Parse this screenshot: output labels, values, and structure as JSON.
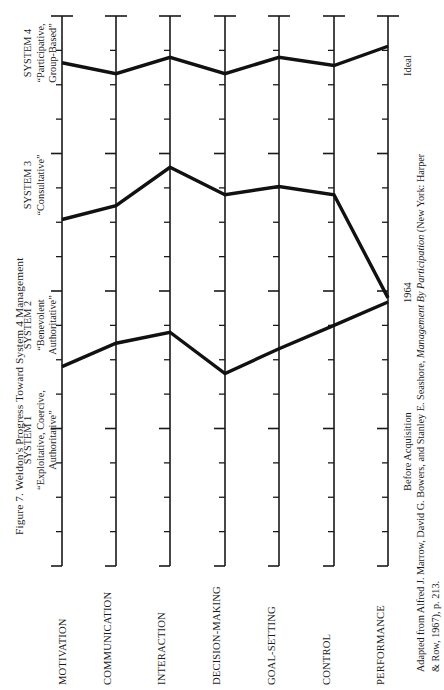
{
  "figure": {
    "title": "Figure 7. Weldon's Progress Toward System 4 Management",
    "orientation": "rotated-90-ccw"
  },
  "source": {
    "line1": "Adapted from Alfred J. Marrow, David G. Bowers, and Stanley E. Seashore, ",
    "line1_italic": "Management By Participation",
    "line1_tail": " (New York: Harper",
    "line2": "& Row, 1967), p. 213."
  },
  "axis": {
    "system_labels": [
      {
        "l1": "SYSTEM 1",
        "l2": "“Exploitative, Coercive,",
        "l3": "Authoritative”"
      },
      {
        "l1": "SYSTEM 2",
        "l2": "“Benevolent",
        "l3": "Authoritative”"
      },
      {
        "l1": "SYSTEM 3",
        "l2": "“Consultative”",
        "l3": ""
      },
      {
        "l1": "SYSTEM 4",
        "l2": "“Participative,",
        "l3": "Group-Based”"
      }
    ],
    "categories": [
      "MOTIVATION",
      "COMMUNICATION",
      "INTERACTION",
      "DECISION-MAKING",
      "GOAL-SETTING",
      "CONTROL",
      "PERFORMANCE"
    ]
  },
  "series_labels": [
    "Before Acquisition",
    "1964",
    "Ideal"
  ],
  "chart_data": {
    "type": "line",
    "title": "Figure 7. Weldon's Progress Toward System 4 Management",
    "xlabel": "",
    "ylabel": "Management System",
    "orientation": "horizontal-categories-vertical-scale",
    "grid": false,
    "legend": "inline-right-labels",
    "categories": [
      "MOTIVATION",
      "COMMUNICATION",
      "INTERACTION",
      "DECISION-MAKING",
      "GOAL-SETTING",
      "CONTROL",
      "PERFORMANCE"
    ],
    "ylim": [
      1.0,
      4.0
    ],
    "ytick_labels": [
      "SYSTEM 1",
      "SYSTEM 2",
      "SYSTEM 3",
      "SYSTEM 4"
    ],
    "ytick_values": [
      1,
      2,
      3,
      4
    ],
    "series": [
      {
        "name": "Before Acquisition",
        "values": [
          1.45,
          1.62,
          1.7,
          1.4,
          1.58,
          1.75,
          1.92
        ]
      },
      {
        "name": "1964",
        "values": [
          2.52,
          2.62,
          2.9,
          2.7,
          2.76,
          2.7,
          1.95
        ]
      },
      {
        "name": "Ideal",
        "values": [
          3.66,
          3.58,
          3.7,
          3.58,
          3.7,
          3.64,
          3.78
        ]
      }
    ]
  },
  "colors": {
    "line": "#111111",
    "axis": "#1a1a1a",
    "background": "#ffffff",
    "text": "#1a1a1a"
  }
}
